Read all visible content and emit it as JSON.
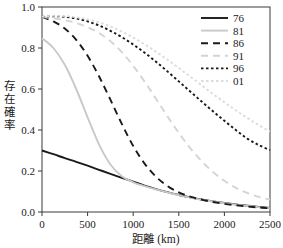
{
  "chart_data": {
    "type": "line",
    "title": "",
    "xlabel": "距離 (km)",
    "ylabel": "存在確率",
    "xlim": [
      0,
      2500
    ],
    "ylim": [
      0.0,
      1.0
    ],
    "grid": false,
    "legend_position": "top-right",
    "xticks": [
      0,
      500,
      1000,
      1500,
      2000,
      2500
    ],
    "xtick_labels": [
      "0",
      "500",
      "1000",
      "1500",
      "2000",
      "2500"
    ],
    "yticks": [
      0.0,
      0.2,
      0.4,
      0.6,
      0.8,
      1.0
    ],
    "ytick_labels": [
      "0.0",
      "0.2",
      "0.4",
      "0.6",
      "0.8",
      "1.0"
    ],
    "x": [
      0,
      125,
      250,
      375,
      500,
      625,
      750,
      875,
      1000,
      1125,
      1250,
      1375,
      1500,
      1625,
      1750,
      1875,
      2000,
      2125,
      2250,
      2375,
      2500
    ],
    "series": [
      {
        "name": "76",
        "label": "76",
        "color": "#1a1a1a",
        "style": "solid",
        "dasharray": "",
        "width": 1.9,
        "values": [
          0.3,
          0.282,
          0.263,
          0.245,
          0.226,
          0.206,
          0.186,
          0.167,
          0.148,
          0.129,
          0.112,
          0.097,
          0.083,
          0.071,
          0.061,
          0.052,
          0.044,
          0.037,
          0.031,
          0.025,
          0.02
        ]
      },
      {
        "name": "81",
        "label": "81",
        "color": "#c9c9c9",
        "style": "solid",
        "dasharray": "",
        "width": 1.9,
        "values": [
          0.848,
          0.8,
          0.718,
          0.6,
          0.462,
          0.33,
          0.232,
          0.175,
          0.145,
          0.126,
          0.11,
          0.096,
          0.082,
          0.07,
          0.06,
          0.051,
          0.043,
          0.036,
          0.03,
          0.024,
          0.019
        ]
      },
      {
        "name": "86",
        "label": "86",
        "color": "#1a1a1a",
        "style": "dashed",
        "dasharray": "7,5",
        "width": 1.9,
        "values": [
          0.952,
          0.93,
          0.895,
          0.84,
          0.762,
          0.662,
          0.548,
          0.43,
          0.322,
          0.236,
          0.172,
          0.127,
          0.096,
          0.075,
          0.06,
          0.049,
          0.04,
          0.033,
          0.027,
          0.022,
          0.018
        ]
      },
      {
        "name": "91",
        "label": "91",
        "color": "#d4d4d4",
        "style": "dashed",
        "dasharray": "7,5",
        "width": 1.9,
        "values": [
          0.952,
          0.945,
          0.936,
          0.922,
          0.902,
          0.873,
          0.833,
          0.78,
          0.713,
          0.636,
          0.552,
          0.467,
          0.386,
          0.312,
          0.248,
          0.195,
          0.152,
          0.118,
          0.093,
          0.074,
          0.06
        ]
      },
      {
        "name": "96",
        "label": "96",
        "color": "#1a1a1a",
        "style": "dotted",
        "dasharray": "2.5,2.5",
        "width": 1.9,
        "values": [
          0.952,
          0.955,
          0.952,
          0.944,
          0.93,
          0.91,
          0.884,
          0.853,
          0.817,
          0.777,
          0.733,
          0.686,
          0.637,
          0.588,
          0.539,
          0.491,
          0.445,
          0.4,
          0.358,
          0.327,
          0.302
        ]
      },
      {
        "name": "01",
        "label": "01",
        "color": "#dcdcdc",
        "style": "dotted",
        "dasharray": "2.5,2.5",
        "width": 1.9,
        "values": [
          0.952,
          0.957,
          0.956,
          0.95,
          0.94,
          0.925,
          0.905,
          0.88,
          0.851,
          0.818,
          0.782,
          0.743,
          0.702,
          0.66,
          0.618,
          0.576,
          0.535,
          0.496,
          0.459,
          0.424,
          0.392
        ]
      }
    ]
  },
  "legend": {
    "entries": [
      {
        "label": "76"
      },
      {
        "label": "81"
      },
      {
        "label": "86"
      },
      {
        "label": "91"
      },
      {
        "label": "96"
      },
      {
        "label": "01"
      }
    ]
  }
}
